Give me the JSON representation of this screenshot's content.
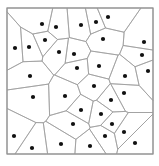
{
  "diagram": {
    "type": "voronoi",
    "frame": {
      "x": 7,
      "y": 8,
      "width": 146,
      "height": 146
    },
    "colors": {
      "background": "#ffffff",
      "frame": "#8a8a8a",
      "edges": "#9a9a9a",
      "seeds": "#111111"
    },
    "seed_radius": 2.1,
    "seeds": [
      [
        42,
        24
      ],
      [
        56,
        27
      ],
      [
        81,
        25
      ],
      [
        96,
        22
      ],
      [
        108,
        17
      ],
      [
        15,
        48
      ],
      [
        29,
        47
      ],
      [
        45,
        40
      ],
      [
        59,
        52
      ],
      [
        74,
        54
      ],
      [
        77,
        68
      ],
      [
        103,
        39
      ],
      [
        144,
        42
      ],
      [
        142,
        55
      ],
      [
        148,
        71
      ],
      [
        99,
        66
      ],
      [
        125,
        76
      ],
      [
        30,
        76
      ],
      [
        33,
        97
      ],
      [
        65,
        96
      ],
      [
        94,
        86
      ],
      [
        124,
        93
      ],
      [
        111,
        100
      ],
      [
        81,
        110
      ],
      [
        101,
        114
      ],
      [
        112,
        124
      ],
      [
        73,
        124
      ],
      [
        124,
        132
      ],
      [
        14,
        136
      ],
      [
        105,
        136
      ],
      [
        32,
        148
      ],
      [
        61,
        144
      ],
      [
        90,
        146
      ],
      [
        135,
        143
      ]
    ]
  }
}
